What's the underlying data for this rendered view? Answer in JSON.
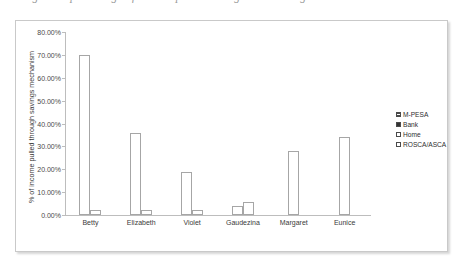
{
  "caption": {
    "text": "Figure 3: percentage of income pulled through each savings mechanism"
  },
  "chart_data": {
    "type": "bar",
    "title": "",
    "xlabel": "",
    "ylabel": "% of income pulled through savings mechanism",
    "ylim": [
      0,
      80
    ],
    "ytick_labels": [
      "80.00%",
      "70.00%",
      "60.00%",
      "50.00%",
      "40.00%",
      "30.00%",
      "20.00%",
      "10.00%",
      "0.00%"
    ],
    "ytick_values": [
      80,
      70,
      60,
      50,
      40,
      30,
      20,
      10,
      0
    ],
    "grid": false,
    "legend_position": "right",
    "categories": [
      "Betty",
      "Elizabeth",
      "Violet",
      "Gaudezina",
      "Margaret",
      "Eunice"
    ],
    "series": [
      {
        "name": "M-PESA",
        "key": "mpesa",
        "values": [
          70.0,
          36.0,
          19.0,
          4.0,
          28.0,
          34.0
        ]
      },
      {
        "name": "Bank",
        "key": "bank",
        "values": [
          0,
          0,
          0,
          0,
          0,
          0
        ]
      },
      {
        "name": "Home",
        "key": "home",
        "values": [
          2.0,
          2.0,
          2.0,
          5.5,
          0,
          0
        ]
      },
      {
        "name": "ROSCA/ASCA",
        "key": "rosca",
        "values": [
          0,
          0,
          0,
          0,
          0,
          0
        ]
      }
    ]
  },
  "legend": {
    "items": [
      {
        "label": "M-PESA",
        "key": "mpesa"
      },
      {
        "label": "Bank",
        "key": "bank"
      },
      {
        "label": "Home",
        "key": "home"
      },
      {
        "label": "ROSCA/ASCA",
        "key": "rosca"
      }
    ]
  },
  "colors": {
    "frame_border": "#c9c9c9",
    "axis_line": "#bdbdbd",
    "bar_outline": "#a6a6a6",
    "text": "#3a3a3a"
  }
}
